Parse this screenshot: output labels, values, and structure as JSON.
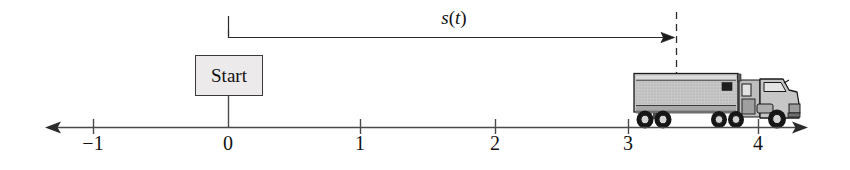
{
  "figure": {
    "type": "number-line-diagram",
    "title": "",
    "background_color": "#ffffff",
    "width": 850,
    "height": 170
  },
  "axis": {
    "name": "position-number-line",
    "line_color": "#4a4a4a",
    "y": 127,
    "x_start": 48,
    "x_end": 806,
    "left_arrow": true,
    "right_arrow": true,
    "ticks": [
      {
        "label": "−1",
        "value": -1,
        "x": 93
      },
      {
        "label": "0",
        "value": 0,
        "x": 228
      },
      {
        "label": "1",
        "value": 1,
        "x": 360
      },
      {
        "label": "2",
        "value": 2,
        "x": 495
      },
      {
        "label": "3",
        "value": 3,
        "x": 628
      },
      {
        "label": "4",
        "value": 4,
        "x": 758
      }
    ],
    "tick_label_y": 133
  },
  "start_marker": {
    "label": "Start",
    "box_x": 195,
    "box_y": 55,
    "box_width": 68,
    "box_height": 41,
    "fill_color": "#eceaea",
    "border_color": "#3a3a3a",
    "stem_x": 228,
    "stem_top": 96,
    "stem_bottom": 127
  },
  "measurement": {
    "label": "s(t)",
    "label_text_italic_s": "s",
    "label_text_paren_open": "(",
    "label_text_italic_t": "t",
    "label_text_paren_close": ")",
    "arrow_y": 37,
    "arrow_x_start": 228,
    "arrow_x_end": 674,
    "left_dash_x": 228,
    "left_dash_top": 16,
    "left_dash_bottom": 37,
    "right_dash_x": 676,
    "right_dash_top": 12,
    "right_dash_bottom": 74,
    "color": "#2a2a2a",
    "measured_value": 3.35
  },
  "truck": {
    "name": "semi-truck",
    "position_value": 3.35,
    "trailer_x": 634,
    "trailer_y": 73,
    "trailer_width": 104,
    "trailer_height": 39,
    "cab_x": 738,
    "cab_width": 62,
    "body_color": "#b9b9b9",
    "panel_color": "#c9c9c9",
    "outline_color": "#1b1b1b",
    "wheels": [
      {
        "cx": 645,
        "cy": 120
      },
      {
        "cx": 663,
        "cy": 120
      },
      {
        "cx": 719,
        "cy": 120
      },
      {
        "cx": 736,
        "cy": 120
      },
      {
        "cx": 777,
        "cy": 120
      }
    ]
  }
}
